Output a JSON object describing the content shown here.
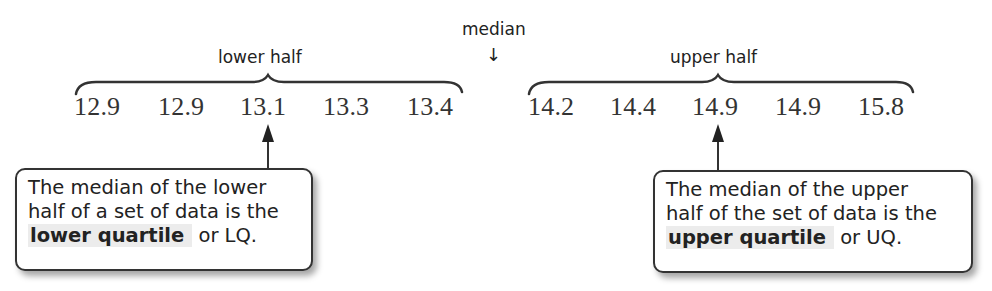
{
  "labels": {
    "median": "median",
    "median_arrow": "↓",
    "lower_half": "lower half",
    "upper_half": "upper half"
  },
  "data": {
    "lower": [
      "12.9",
      "12.9",
      "13.1",
      "13.3",
      "13.4"
    ],
    "upper": [
      "14.2",
      "14.4",
      "14.9",
      "14.9",
      "15.8"
    ]
  },
  "callouts": {
    "lower": {
      "line1": "The median of the lower",
      "line2": "half of a set of data is the",
      "term": "lower quartile",
      "tail": "or LQ."
    },
    "upper": {
      "line1": "The median of the upper",
      "line2": "half of the set of data is the",
      "term": "upper quartile",
      "tail": "or UQ."
    }
  },
  "colors": {
    "text": "#2a2a2a",
    "highlight": "#ececec",
    "stroke": "#333333"
  }
}
